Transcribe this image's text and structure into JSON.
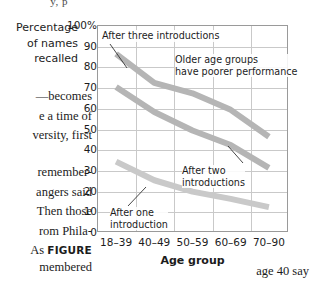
{
  "page": {
    "cut_text": "y, p",
    "body_lines": [
      "—becomes",
      "e a time of",
      "versity, first",
      "remember-",
      "angers said",
      "Then those",
      "rom Phila-",
      "As ",
      "membered",
      "age 40 say"
    ],
    "figure_word": "FIGURE"
  },
  "chart_data": {
    "type": "line",
    "title": "",
    "xlabel": "Age group",
    "ylabel": "Percentage of names recalled",
    "ylabel_lines": [
      "Percentage",
      "of names",
      "recalled"
    ],
    "categories": [
      "18–39",
      "40–49",
      "50–59",
      "60–69",
      "70–90"
    ],
    "ylim": [
      0,
      100
    ],
    "yticks": [
      0,
      10,
      20,
      30,
      40,
      50,
      60,
      70,
      80,
      90,
      100
    ],
    "ytick_labels": [
      "0",
      "10",
      "20",
      "30",
      "40",
      "50",
      "60",
      "70",
      "80",
      "90",
      "100%"
    ],
    "grid": true,
    "legend": "none",
    "series": [
      {
        "name": "After three introductions",
        "values": [
          86,
          72,
          67,
          59,
          46
        ],
        "color": "#b5b5b5"
      },
      {
        "name": "After two introductions",
        "values": [
          70,
          58,
          49,
          42,
          31
        ],
        "color": "#b5b5b5"
      },
      {
        "name": "After one introduction",
        "values": [
          34,
          25,
          19.5,
          16,
          12
        ],
        "color": "#c9c9c9"
      }
    ],
    "annotations": [
      {
        "id": "three",
        "text": "After three introductions"
      },
      {
        "id": "older",
        "text": "Older age groups\nhave poorer performance"
      },
      {
        "id": "two",
        "text": "After two\nintroductions"
      },
      {
        "id": "one",
        "text": "After one\nintroduction"
      }
    ]
  }
}
